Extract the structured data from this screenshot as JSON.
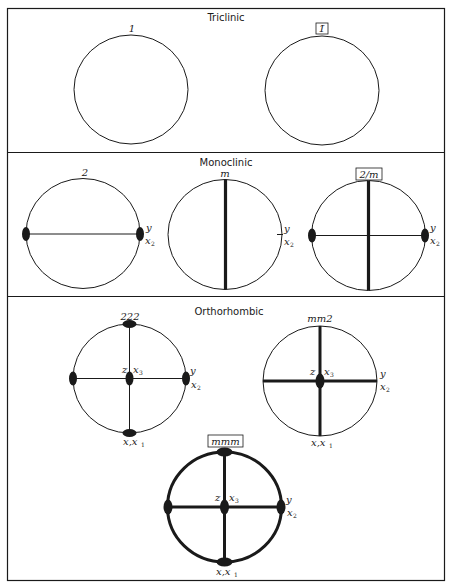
{
  "figure": {
    "sections": [
      {
        "title": "Triclinic",
        "groups": [
          {
            "symbol": "1",
            "boxed": false,
            "axis_labels": []
          },
          {
            "symbol": "1̄",
            "boxed": true,
            "axis_labels": []
          }
        ]
      },
      {
        "title": "Monoclinic",
        "groups": [
          {
            "symbol": "2",
            "boxed": false,
            "axis_labels": [
              "y",
              "x",
              "2"
            ]
          },
          {
            "symbol": "m",
            "boxed": false,
            "axis_labels": [
              "y",
              "x",
              "2"
            ]
          },
          {
            "symbol": "2/m",
            "boxed": true,
            "axis_labels": [
              "y",
              "x",
              "2"
            ]
          }
        ]
      },
      {
        "title": "Orthorhombic",
        "groups": [
          {
            "symbol": "222",
            "boxed": false,
            "axis_labels": [
              "z",
              "x",
              "3",
              "y",
              "x",
              "2",
              "x,x",
              "1"
            ]
          },
          {
            "symbol": "mm2",
            "boxed": false,
            "axis_labels": [
              "z",
              "x",
              "3",
              "y",
              "x",
              "2",
              "x,x",
              "1"
            ]
          },
          {
            "symbol": "mmm",
            "boxed": true,
            "axis_labels": [
              "z",
              "x",
              "3",
              "y",
              "x",
              "2",
              "x,x",
              "1"
            ]
          }
        ]
      }
    ],
    "colors": {
      "ink": "#1a1a1a",
      "background": "#ffffff"
    }
  }
}
